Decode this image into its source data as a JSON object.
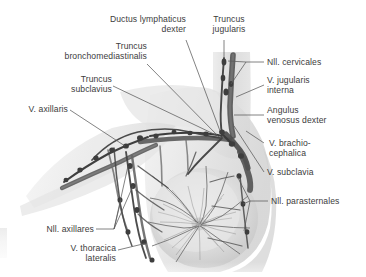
{
  "figure": {
    "kind": "anatomical-illustration",
    "style": "grayscale medical atlas halftone",
    "background_color": "#ffffff",
    "text_color": "#3c3c3c",
    "leader_line_color": "#5a5a5a",
    "vessel_dark": "#4a4a4a",
    "vessel_mid": "#7d7d7d",
    "tissue_light": "#dedede",
    "tissue_mid": "#c6c6c6"
  },
  "labels": {
    "ductus_lymphaticus_dexter": "Ductus lymphaticus\ndexter",
    "truncus_jugularis": "Truncus\njugularis",
    "truncus_bronchomediastinalis": "Truncus\nbronchomediastinalis",
    "truncus_subclavius": "Truncus\nsubclavius",
    "v_axillaris": "V. axillaris",
    "nll_cervicales": "Nll. cervicales",
    "v_jugularis_interna": "V. jugularis\ninterna",
    "angulus_venosus_dexter": "Angulus\nvenosus dexter",
    "v_brachiocephalica": "V. brachio-\ncephalica",
    "v_subclavia": "V. subclavia",
    "nll_parasternales": "Nll. parasternales",
    "nll_axillares": "Nll. axillares",
    "v_thoracica_lateralis": "V. thoracica\nlateralis"
  },
  "structures": [
    {
      "name": "Ductus lymphaticus dexter",
      "side": "right",
      "type": "lymphatic-duct"
    },
    {
      "name": "Truncus jugularis",
      "side": "right",
      "type": "lymphatic-trunk"
    },
    {
      "name": "Truncus bronchomediastinalis",
      "side": "right",
      "type": "lymphatic-trunk"
    },
    {
      "name": "Truncus subclavius",
      "side": "right",
      "type": "lymphatic-trunk"
    },
    {
      "name": "V. axillaris",
      "side": "right",
      "type": "vein"
    },
    {
      "name": "Nll. cervicales",
      "side": "right",
      "type": "lymph-nodes"
    },
    {
      "name": "V. jugularis interna",
      "side": "right",
      "type": "vein"
    },
    {
      "name": "Angulus venosus dexter",
      "side": "right",
      "type": "venous-angle"
    },
    {
      "name": "V. brachiocephalica",
      "side": "right",
      "type": "vein"
    },
    {
      "name": "V. subclavia",
      "side": "right",
      "type": "vein"
    },
    {
      "name": "Nll. parasternales",
      "side": "right",
      "type": "lymph-nodes"
    },
    {
      "name": "Nll. axillares",
      "side": "right",
      "type": "lymph-nodes"
    },
    {
      "name": "V. thoracica lateralis",
      "side": "right",
      "type": "vein"
    }
  ]
}
